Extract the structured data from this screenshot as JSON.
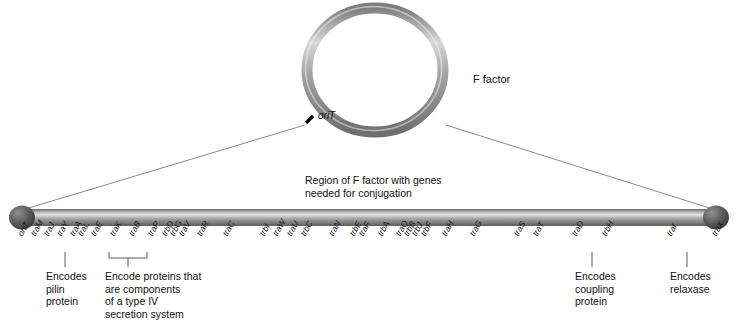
{
  "diagram": {
    "title_label": "F factor",
    "origin_label": "oriT",
    "region_caption_line1": "Region of F factor with genes",
    "region_caption_line2": "needed for conjugation",
    "colors": {
      "ring_light": "#d2d2d2",
      "ring_mid": "#8e8e8e",
      "ring_dark": "#6b6b6b",
      "bar_light": "#dcdcdc",
      "bar_mid": "#9a9a9a",
      "bar_dark": "#5f5f5f",
      "cap_dark": "#4a4a4a",
      "orit_tick": "#000000",
      "leader_line": "#555555",
      "text": "#111111"
    }
  },
  "notes": [
    {
      "id": "pilin",
      "lines": [
        "Encodes",
        "pilin",
        "protein"
      ],
      "points_to": "traA"
    },
    {
      "id": "t4ss",
      "lines": [
        "Encode proteins that",
        "are components",
        "of a type IV",
        "secretion system"
      ],
      "points_to": "traK-traP"
    },
    {
      "id": "coupling",
      "lines": [
        "Encodes",
        "coupling",
        "protein"
      ],
      "points_to": "traD"
    },
    {
      "id": "relaxase",
      "lines": [
        "Encodes",
        "relaxase"
      ],
      "points_to": "traI"
    }
  ],
  "genes": [
    {
      "label": "oriT",
      "x": 20
    },
    {
      "label": "traM",
      "x": 33
    },
    {
      "label": "traJ",
      "x": 46
    },
    {
      "label": "traY",
      "x": 59
    },
    {
      "label": "traA",
      "x": 72
    },
    {
      "label": "traL",
      "x": 80
    },
    {
      "label": "traE",
      "x": 93
    },
    {
      "label": "traK",
      "x": 112
    },
    {
      "label": "traB",
      "x": 131
    },
    {
      "label": "traP",
      "x": 150
    },
    {
      "label": "trbD",
      "x": 164
    },
    {
      "label": "trbG",
      "x": 172
    },
    {
      "label": "traV",
      "x": 181
    },
    {
      "label": "traR",
      "x": 199
    },
    {
      "label": "traC",
      "x": 225
    },
    {
      "label": "trbI",
      "x": 262
    },
    {
      "label": "traW",
      "x": 275
    },
    {
      "label": "traU",
      "x": 289
    },
    {
      "label": "trbC",
      "x": 303
    },
    {
      "label": "traN",
      "x": 331
    },
    {
      "label": "trbE",
      "x": 352
    },
    {
      "label": "traF",
      "x": 361
    },
    {
      "label": "trbA",
      "x": 380
    },
    {
      "label": "traQ",
      "x": 398
    },
    {
      "label": "trbB",
      "x": 406
    },
    {
      "label": "trbJ",
      "x": 414
    },
    {
      "label": "trbF",
      "x": 423
    },
    {
      "label": "traH",
      "x": 444
    },
    {
      "label": "traG",
      "x": 472
    },
    {
      "label": "traS",
      "x": 516
    },
    {
      "label": "traT",
      "x": 535
    },
    {
      "label": "traD",
      "x": 574
    },
    {
      "label": "trbH",
      "x": 604
    },
    {
      "label": "traI",
      "x": 669
    },
    {
      "label": "traX",
      "x": 714
    }
  ]
}
